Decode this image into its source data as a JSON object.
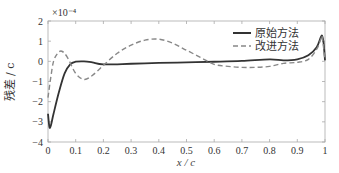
{
  "chart_data": {
    "type": "line",
    "title": "",
    "xlabel": "x / c",
    "ylabel": "残差 / c",
    "y_multiplier": "×10⁻⁴",
    "xlim": [
      0,
      1
    ],
    "ylim": [
      -4,
      2
    ],
    "xticks": [
      0,
      0.1,
      0.2,
      0.3,
      0.4,
      0.5,
      0.6,
      0.7,
      0.8,
      0.9,
      1
    ],
    "xtick_labels": [
      "0",
      "0.1",
      "0.2",
      "0.3",
      "0.4",
      "0.5",
      "0.6",
      "0.7",
      "0.8",
      "0.9",
      "1"
    ],
    "yticks": [
      2,
      1,
      0,
      -1,
      -2,
      -3,
      -4
    ],
    "ytick_labels": [
      "2",
      "1",
      "0",
      "−1",
      "−2",
      "−3",
      "−4"
    ],
    "grid": false,
    "legend_position": "upper right",
    "series": [
      {
        "name": "原始方法",
        "style": "solid",
        "color": "#333333",
        "x": [
          0,
          0.005,
          0.01,
          0.02,
          0.04,
          0.06,
          0.08,
          0.1,
          0.13,
          0.16,
          0.2,
          0.3,
          0.4,
          0.5,
          0.6,
          0.7,
          0.8,
          0.85,
          0.9,
          0.94,
          0.97,
          0.985,
          0.99,
          0.995,
          1.0
        ],
        "y": [
          -2.6,
          -3.25,
          -3.2,
          -2.6,
          -1.5,
          -0.6,
          -0.15,
          -0.02,
          0.0,
          -0.05,
          -0.15,
          -0.12,
          -0.08,
          -0.05,
          -0.02,
          0.02,
          0.1,
          0.05,
          0.1,
          0.3,
          0.7,
          1.2,
          1.25,
          0.9,
          0.05
        ]
      },
      {
        "name": "改进方法",
        "style": "dashed",
        "color": "#888888",
        "x": [
          0,
          0.01,
          0.02,
          0.035,
          0.05,
          0.07,
          0.1,
          0.13,
          0.16,
          0.2,
          0.25,
          0.3,
          0.35,
          0.4,
          0.45,
          0.5,
          0.55,
          0.6,
          0.65,
          0.7,
          0.75,
          0.8,
          0.85,
          0.9,
          0.94,
          0.97,
          0.985,
          0.99,
          1.0
        ],
        "y": [
          -1.8,
          -0.8,
          0.0,
          0.4,
          0.5,
          0.2,
          -0.6,
          -0.9,
          -0.7,
          -0.2,
          0.4,
          0.8,
          1.05,
          1.1,
          0.9,
          0.55,
          0.2,
          -0.15,
          -0.25,
          -0.3,
          -0.3,
          -0.25,
          -0.1,
          -0.05,
          0.1,
          0.6,
          1.1,
          1.2,
          0.05
        ]
      }
    ]
  }
}
